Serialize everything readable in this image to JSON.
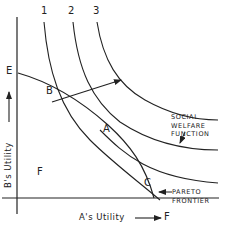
{
  "diagram": {
    "title": "",
    "axes": {
      "x_label": "A's Utility",
      "y_label": "B's Utility",
      "x_end_label": "F",
      "y_end_label": "E"
    },
    "curve_labels": [
      "1",
      "2",
      "3"
    ],
    "points": {
      "B": "B",
      "A": "A",
      "C": "C"
    },
    "region_label": "F",
    "annotations": {
      "social_welfare_function": [
        "SOCIAL",
        "WELFARE",
        "FUNCTION"
      ],
      "pareto_frontier": [
        "PARETO",
        "FRONTIER"
      ]
    },
    "colors": {
      "line": "#222222",
      "background": "#ffffff"
    }
  }
}
